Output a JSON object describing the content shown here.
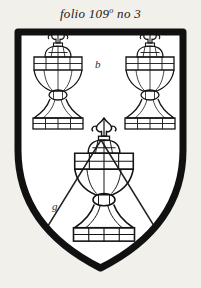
{
  "document": {
    "title": "folio 109 no 3",
    "caption": {
      "prefix": "folio 109",
      "superscript": "o",
      "suffix": "no 3"
    },
    "background_color": "#f2f0eb",
    "ink_color": "#111111"
  },
  "shield": {
    "name": "escutcheon",
    "outline_color": "#111111",
    "outline_width": 7,
    "field_color": "#ffffff",
    "annotations": [
      {
        "id": "chief",
        "label": "b",
        "position": "center-chief",
        "meaning": "tincture-mark"
      },
      {
        "id": "base",
        "label": "g",
        "position": "lower-dexter",
        "meaning": "tincture-mark"
      }
    ]
  },
  "ordinary": {
    "name": "chevron",
    "stroke_color": "#222222",
    "stroke_width": 1.4
  },
  "charges": [
    {
      "id": "urn-dexter-chief",
      "name": "covered-urn",
      "position": "dexter-chief",
      "cx": 58,
      "cy": 92,
      "scale": 1.0
    },
    {
      "id": "urn-sinister-chief",
      "name": "covered-urn",
      "position": "sinister-chief",
      "cx": 150,
      "cy": 92,
      "scale": 1.0
    },
    {
      "id": "urn-base",
      "name": "covered-urn",
      "position": "base",
      "cx": 104,
      "cy": 196,
      "scale": 1.22
    }
  ]
}
